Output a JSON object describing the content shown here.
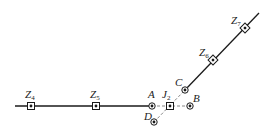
{
  "diagram": {
    "type": "node-line-schematic",
    "colors": {
      "line": "#1a1a1a",
      "dashed": "#888888",
      "node": "#1a1a1a",
      "background": "#ffffff"
    },
    "nodes": [
      {
        "id": "Z4",
        "label": "Z",
        "sub": "4",
        "kind": "square",
        "x": 31,
        "y": 106
      },
      {
        "id": "Z5",
        "label": "Z",
        "sub": "5",
        "kind": "square",
        "x": 96,
        "y": 106
      },
      {
        "id": "A",
        "label": "A",
        "sub": "",
        "kind": "circle",
        "x": 152,
        "y": 106
      },
      {
        "id": "J2",
        "label": "J",
        "sub": "2",
        "kind": "square",
        "x": 170,
        "y": 106
      },
      {
        "id": "B",
        "label": "B",
        "sub": "",
        "kind": "circle",
        "x": 190,
        "y": 106
      },
      {
        "id": "C",
        "label": "C",
        "sub": "",
        "kind": "circle",
        "x": 185,
        "y": 90
      },
      {
        "id": "D",
        "label": "D",
        "sub": "",
        "kind": "circle",
        "x": 154,
        "y": 122
      },
      {
        "id": "Z6",
        "label": "Z",
        "sub": "6",
        "kind": "square",
        "x": 213,
        "y": 60
      },
      {
        "id": "Z7",
        "label": "Z",
        "sub": "7",
        "kind": "square",
        "x": 245,
        "y": 28
      }
    ],
    "labels": {
      "Z4": "Z4",
      "Z5": "Z5",
      "A": "A",
      "J2": "J2",
      "B": "B",
      "C": "C",
      "D": "D",
      "Z6": "Z6",
      "Z7": "Z7"
    }
  }
}
